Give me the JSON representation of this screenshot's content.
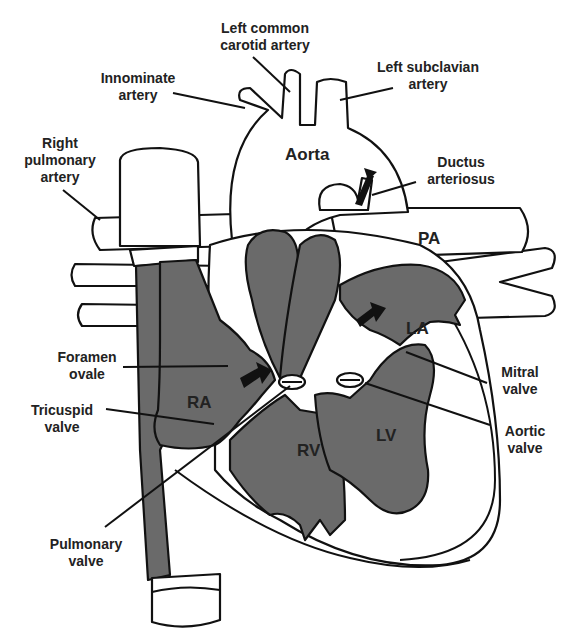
{
  "diagram": {
    "colors": {
      "background": "#ffffff",
      "outline": "#111111",
      "chamber_fill": "#6a6a6a",
      "label_text": "#222222"
    },
    "labels": {
      "left_common_carotid": [
        "Left common",
        "carotid artery"
      ],
      "innominate": [
        "Innominate",
        "artery"
      ],
      "left_subclavian": [
        "Left subclavian",
        "artery"
      ],
      "aorta": "Aorta",
      "right_pulmonary": [
        "Right",
        "pulmonary",
        "artery"
      ],
      "ductus": [
        "Ductus",
        "arteriosus"
      ],
      "pa": "PA",
      "la": "LA",
      "foramen_ovale": [
        "Foramen",
        "ovale"
      ],
      "mitral_valve": [
        "Mitral",
        "valve"
      ],
      "ra": "RA",
      "tricuspid_valve": [
        "Tricuspid",
        "valve"
      ],
      "aortic_valve": [
        "Aortic",
        "valve"
      ],
      "rv": "RV",
      "lv": "LV",
      "pulmonary_valve": [
        "Pulmonary",
        "valve"
      ]
    },
    "icons": {
      "flow_arrow": "arrow-right-filled"
    }
  }
}
